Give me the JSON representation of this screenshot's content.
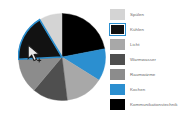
{
  "chart_data": {
    "type": "pie",
    "title": "",
    "legend_position": "right",
    "grid": false,
    "categories": [
      "Spülen",
      "Kühlen",
      "Licht",
      "Warmwasser",
      "Raumwärme",
      "Kochen",
      "Kommunikationstechnik"
    ],
    "values": [
      9,
      17,
      14,
      13,
      13,
      12,
      22
    ],
    "colors": [
      "#d4d4d4",
      "#121212",
      "#a8a8a8",
      "#4f4f4f",
      "#8c8c8c",
      "#2b8fd0",
      "#000000"
    ],
    "labels": [],
    "selected_category": "Kühlen",
    "slices": [
      {
        "label": "Kommunikationstechnik",
        "value": 22,
        "color": "#000000",
        "start_deg": 0,
        "end_deg": 79
      },
      {
        "label": "Kochen",
        "value": 12,
        "color": "#2b8fd0",
        "start_deg": 79,
        "end_deg": 122
      },
      {
        "label": "Licht",
        "value": 14,
        "color": "#a8a8a8",
        "start_deg": 122,
        "end_deg": 173
      },
      {
        "label": "Warmwasser",
        "value": 13,
        "color": "#4f4f4f",
        "start_deg": 173,
        "end_deg": 220
      },
      {
        "label": "Raumwärme",
        "value": 13,
        "color": "#8c8c8c",
        "start_deg": 220,
        "end_deg": 267
      },
      {
        "label": "Kühlen",
        "value": 17,
        "color": "#121212",
        "start_deg": 267,
        "end_deg": 329
      },
      {
        "label": "Spülen",
        "value": 9,
        "color": "#d4d4d4",
        "start_deg": 329,
        "end_deg": 360
      }
    ]
  },
  "legend": {
    "items": [
      {
        "label": "Spülen",
        "color": "#d4d4d4",
        "selected": false
      },
      {
        "label": "Kühlen",
        "color": "#121212",
        "selected": true
      },
      {
        "label": "Licht",
        "color": "#a8a8a8",
        "selected": false
      },
      {
        "label": "Warmwasser",
        "color": "#4f4f4f",
        "selected": false
      },
      {
        "label": "Raumwärme",
        "color": "#8c8c8c",
        "selected": false
      },
      {
        "label": "Kochen",
        "color": "#2b8fd0",
        "selected": false
      },
      {
        "label": "Kommunikationstechnik",
        "color": "#000000",
        "selected": false
      }
    ]
  },
  "cursor": {
    "type": "arrow-plus",
    "x": 30,
    "y": 52
  },
  "theme": {
    "background": "#ffffff",
    "accent": "#2b8fd0",
    "selection_border": "#2b8fd0",
    "label_color": "#6b6b6b"
  }
}
